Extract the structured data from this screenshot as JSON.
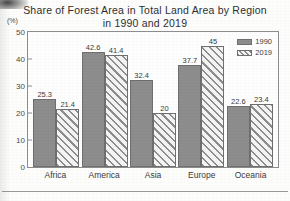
{
  "chart_data": {
    "type": "bar",
    "title": "Share of Forest Area in Total Land Area by Region in 1990 and 2019",
    "title_lines": [
      "Share of Forest Area in Total Land Area by Region",
      "in 1990 and 2019"
    ],
    "xlabel": "",
    "ylabel": "",
    "yunit": "(%)",
    "ylim": [
      0,
      50
    ],
    "yticks": [
      0,
      10,
      20,
      30,
      40,
      50
    ],
    "ytick_labels": [
      "0",
      "10",
      "20",
      "30",
      "40",
      "50"
    ],
    "grid": false,
    "legend_position": "top-right",
    "categories": [
      "Africa",
      "America",
      "Asia",
      "Europe",
      "Oceania"
    ],
    "series": [
      {
        "name": "1990",
        "fill": "solid",
        "color": "#8d8d8d",
        "values": [
          25.3,
          42.6,
          32.4,
          37.7,
          22.6
        ],
        "labels": [
          "25.3",
          "42.6",
          "32.4",
          "37.7",
          "22.6"
        ]
      },
      {
        "name": "2019",
        "fill": "diagonal-hatch",
        "color": "#8d8d8d",
        "values": [
          21.4,
          41.4,
          20,
          45,
          23.4
        ],
        "labels": [
          "21.4",
          "41.4",
          "20",
          "45",
          "23.4"
        ]
      }
    ]
  },
  "legend": {
    "entries": [
      {
        "label": "1990"
      },
      {
        "label": "2019"
      }
    ]
  }
}
